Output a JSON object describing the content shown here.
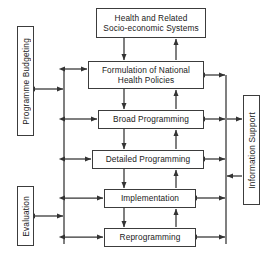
{
  "diagram": {
    "colors": {
      "stroke": "#3c3c3c",
      "arrow": "#333333",
      "text": "#1a1a1a",
      "background": "#ffffff"
    },
    "process_nodes": [
      {
        "id": "health-systems",
        "label": "Health and Related\nSocio-economic Systems",
        "x": 96,
        "y": 8,
        "w": 110,
        "h": 30
      },
      {
        "id": "formulation",
        "label": "Formulation of National\nHealth Policies",
        "x": 88,
        "y": 61,
        "w": 116,
        "h": 28
      },
      {
        "id": "broad-programming",
        "label": "Broad Programming",
        "x": 98,
        "y": 110,
        "w": 106,
        "h": 19
      },
      {
        "id": "detailed-programming",
        "label": "Detailed Programming",
        "x": 92,
        "y": 150,
        "w": 112,
        "h": 19
      },
      {
        "id": "implementation",
        "label": "Implementation",
        "x": 104,
        "y": 189,
        "w": 92,
        "h": 19
      },
      {
        "id": "reprogramming",
        "label": "Reprogramming",
        "x": 104,
        "y": 228,
        "w": 92,
        "h": 19
      }
    ],
    "side_nodes": [
      {
        "id": "programme-budgeting",
        "label": "Programme Budgeting",
        "x": 17,
        "y": 26,
        "w": 17,
        "h": 110,
        "side": "left"
      },
      {
        "id": "evaluation",
        "label": "Evaluation",
        "x": 17,
        "y": 186,
        "w": 17,
        "h": 60,
        "side": "left"
      },
      {
        "id": "information-support",
        "label": "Information Support",
        "x": 243,
        "y": 95,
        "w": 17,
        "h": 110,
        "side": "right"
      }
    ],
    "connectors": {
      "left_bus_x": 64,
      "right_bus_x": 226,
      "down_arrow_x": 124,
      "up_arrow_x": 176,
      "note": "Bidirectional arrows link each process node to the left and right vertical buses; single arrows chain the nodes top-to-bottom with feedback arrows running upward."
    }
  }
}
